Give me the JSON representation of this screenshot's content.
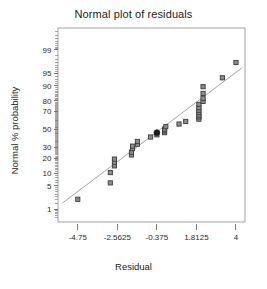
{
  "chart_data": {
    "type": "scatter",
    "title": "Normal plot of residuals",
    "xlabel": "Residual",
    "ylabel": "Normal % probability",
    "grid": false,
    "legend": null,
    "xlim": [
      -5.84375,
      4.5
    ],
    "x_ticks": [
      -4.75,
      -2.5625,
      -0.375,
      1.8125,
      4
    ],
    "x_tick_labels": [
      "-4.75",
      "-2.5625",
      "-0.375",
      "1.8125",
      "4"
    ],
    "y_scale": "probability",
    "y_ticks": [
      1,
      5,
      10,
      20,
      30,
      50,
      70,
      80,
      90,
      95,
      99
    ],
    "y_tick_labels": [
      "1",
      "5",
      "10",
      "20",
      "30",
      "50",
      "70",
      "80",
      "90",
      "95",
      "99"
    ],
    "ylim": [
      0.35,
      99.85
    ],
    "reference_line": {
      "description": "normal reference line",
      "x_start": -5.6,
      "y_start": 1.6,
      "x_end": 4.35,
      "y_end": 96.5
    },
    "series": [
      {
        "name": "residuals",
        "marker": "square",
        "points": [
          {
            "x": -4.75,
            "p": 2.1
          },
          {
            "x": -2.95,
            "p": 6.0
          },
          {
            "x": -2.95,
            "p": 10.5
          },
          {
            "x": -2.72,
            "p": 14.5
          },
          {
            "x": -2.72,
            "p": 17.0
          },
          {
            "x": -2.72,
            "p": 19.5
          },
          {
            "x": -1.78,
            "p": 23.0
          },
          {
            "x": -1.78,
            "p": 25.5
          },
          {
            "x": -1.72,
            "p": 29.0
          },
          {
            "x": -1.72,
            "p": 31.5
          },
          {
            "x": -1.45,
            "p": 33.5
          },
          {
            "x": -1.45,
            "p": 36.5
          },
          {
            "x": -0.72,
            "p": 41.5
          },
          {
            "x": -0.375,
            "p": 44.0
          },
          {
            "x": 0.05,
            "p": 46.5
          },
          {
            "x": 0.05,
            "p": 48.5
          },
          {
            "x": 0.05,
            "p": 50.5
          },
          {
            "x": 0.12,
            "p": 53.5
          },
          {
            "x": 0.85,
            "p": 56.5
          },
          {
            "x": 1.22,
            "p": 59.5
          },
          {
            "x": 1.95,
            "p": 62.0
          },
          {
            "x": 1.95,
            "p": 64.5
          },
          {
            "x": 1.95,
            "p": 66.5
          },
          {
            "x": 1.95,
            "p": 69.0
          },
          {
            "x": 1.95,
            "p": 71.5
          },
          {
            "x": 1.95,
            "p": 74.0
          },
          {
            "x": 1.95,
            "p": 77.0
          },
          {
            "x": 2.18,
            "p": 79.5
          },
          {
            "x": 2.18,
            "p": 82.0
          },
          {
            "x": 2.18,
            "p": 85.5
          },
          {
            "x": 2.18,
            "p": 89.5
          },
          {
            "x": 3.25,
            "p": 93.5
          },
          {
            "x": 4.0,
            "p": 97.5
          }
        ]
      },
      {
        "name": "highlighted-residual",
        "marker": "filled-circle",
        "points": [
          {
            "x": -0.375,
            "p": 46.5
          }
        ]
      }
    ]
  },
  "colors": {
    "axis": "#6e6e6e",
    "frame": "#8a8a8a",
    "marker_fill": "#8c8c8c",
    "marker_edge": "#3c3c3c",
    "highlight": "#1a1a1a",
    "line": "#9a9a9a",
    "text": "#222222"
  }
}
